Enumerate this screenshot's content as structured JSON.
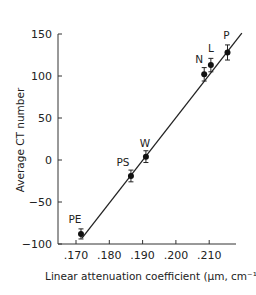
{
  "chart_data": {
    "type": "scatter",
    "title": "",
    "xlabel": "Linear attenuation coefficient (µm, cm⁻¹)",
    "ylabel": "Average CT number",
    "xlim": [
      0.165,
      0.2185
    ],
    "ylim": [
      -100,
      150
    ],
    "x_ticks": [
      ".170",
      ".180",
      ".190",
      ".200",
      ".210"
    ],
    "y_ticks": [
      "150",
      "100",
      "50",
      "0",
      "−50",
      "−100"
    ],
    "grid": false,
    "legend": null,
    "series": [
      {
        "name": "materials",
        "points": [
          {
            "label": "PE",
            "x": 0.1715,
            "y": -88,
            "err": 6
          },
          {
            "label": "PS",
            "x": 0.1865,
            "y": -19,
            "err": 7
          },
          {
            "label": "W",
            "x": 0.191,
            "y": 4,
            "err": 7
          },
          {
            "label": "N",
            "x": 0.2085,
            "y": 102,
            "err": 8
          },
          {
            "label": "L",
            "x": 0.2105,
            "y": 113,
            "err": 8
          },
          {
            "label": "P",
            "x": 0.2155,
            "y": 128,
            "err": 9
          }
        ]
      }
    ],
    "fit_line": {
      "x": [
        0.1718,
        0.2198
      ],
      "y": [
        -93,
        151
      ]
    }
  }
}
